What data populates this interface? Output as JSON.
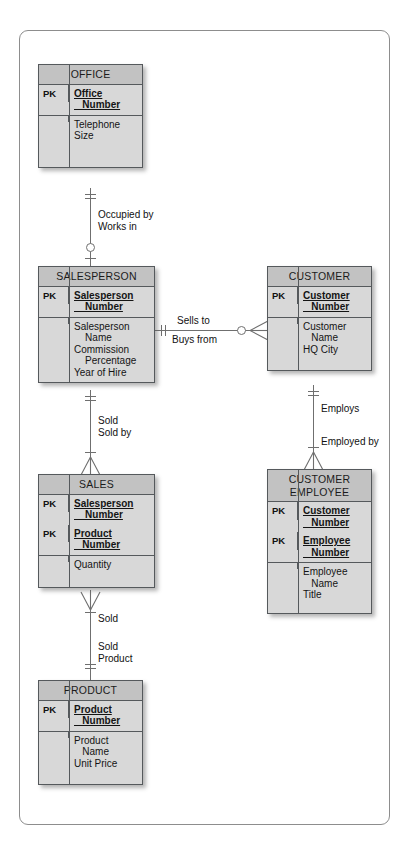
{
  "diagram": {
    "notation": "crows-foot",
    "entities": [
      {
        "id": "office",
        "name": "OFFICE",
        "groups": [
          {
            "pk": "PK",
            "key": true,
            "lines": [
              "Office",
              "   Number"
            ]
          },
          {
            "pk": "",
            "key": false,
            "lines": [
              "Telephone",
              "Size"
            ]
          }
        ]
      },
      {
        "id": "salesperson",
        "name": "SALESPERSON",
        "groups": [
          {
            "pk": "PK",
            "key": true,
            "lines": [
              "Salesperson",
              "    Number"
            ]
          },
          {
            "pk": "",
            "key": false,
            "lines": [
              "Salesperson",
              "    Name",
              "Commission",
              "    Percentage",
              "Year of Hire"
            ]
          }
        ]
      },
      {
        "id": "customer",
        "name": "CUSTOMER",
        "groups": [
          {
            "pk": "PK",
            "key": true,
            "lines": [
              "Customer",
              "   Number"
            ]
          },
          {
            "pk": "",
            "key": false,
            "lines": [
              "Customer",
              "   Name",
              "HQ City"
            ]
          }
        ]
      },
      {
        "id": "sales",
        "name": "SALES",
        "groups": [
          {
            "pk": "PK",
            "key": true,
            "lines": [
              "Salesperson",
              "    Number"
            ]
          },
          {
            "pk": "PK",
            "key": true,
            "lines": [
              "Product",
              "   Number"
            ]
          },
          {
            "pk": "",
            "key": false,
            "lines": [
              "Quantity"
            ]
          }
        ]
      },
      {
        "id": "customer-employee",
        "name": "CUSTOMER\nEMPLOYEE",
        "groups": [
          {
            "pk": "PK",
            "key": true,
            "lines": [
              "Customer",
              "   Number"
            ]
          },
          {
            "pk": "PK",
            "key": true,
            "lines": [
              "Employee",
              "   Number"
            ]
          },
          {
            "pk": "",
            "key": false,
            "lines": [
              "Employee",
              "   Name",
              "Title"
            ]
          }
        ]
      },
      {
        "id": "product",
        "name": "PRODUCT",
        "groups": [
          {
            "pk": "PK",
            "key": true,
            "lines": [
              "Product",
              "   Number"
            ]
          },
          {
            "pk": "",
            "key": false,
            "lines": [
              "Product",
              "   Name",
              "Unit Price"
            ]
          }
        ]
      }
    ],
    "relationships": [
      {
        "id": "office-salesperson",
        "from": "OFFICE",
        "to": "SALESPERSON",
        "forward_label": "Occupied by",
        "reverse_label": "Works in"
      },
      {
        "id": "salesperson-customer",
        "from": "SALESPERSON",
        "to": "CUSTOMER",
        "forward_label": "Sells to",
        "reverse_label": "Buys from"
      },
      {
        "id": "salesperson-sales",
        "from": "SALESPERSON",
        "to": "SALES",
        "forward_label": "Sold",
        "reverse_label": "Sold by"
      },
      {
        "id": "customer-customeremployee",
        "from": "CUSTOMER",
        "to": "CUSTOMER EMPLOYEE",
        "forward_label": "Employs",
        "reverse_label": "Employed by"
      },
      {
        "id": "sales-product",
        "from": "SALES",
        "to": "PRODUCT",
        "forward_label": "Sold",
        "reverse_label": "Sold\nProduct"
      }
    ]
  },
  "labels": {
    "occupied_by": "Occupied by",
    "works_in": "Works in",
    "sells_to": "Sells to",
    "buys_from": "Buys from",
    "sold": "Sold",
    "sold_by": "Sold by",
    "employs": "Employs",
    "employed_by": "Employed by",
    "sold2": "Sold",
    "sold_product_1": "Sold",
    "sold_product_2": "Product"
  },
  "colors": {
    "entity_header": "#c2c2c2",
    "entity_body": "#d8d8d8",
    "entity_border": "#55595c",
    "line": "#6f6f6f",
    "frame": "#8d8d8d",
    "background": "#ffffff",
    "text": "#141414"
  }
}
